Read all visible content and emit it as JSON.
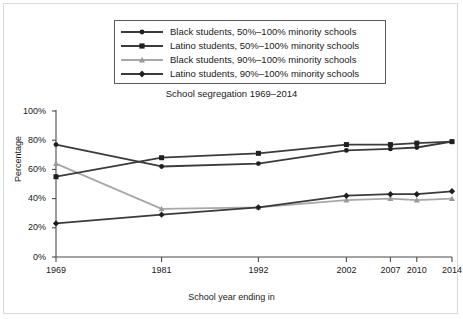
{
  "chart_data": {
    "type": "line",
    "title": "School segregation 1969–2014",
    "xlabel": "School year ending in",
    "ylabel": "Percentage",
    "categories": [
      "1969",
      "1981",
      "1992",
      "2002",
      "2007",
      "2010",
      "2014"
    ],
    "x": [
      1969,
      1981,
      1992,
      2002,
      2007,
      2010,
      2014
    ],
    "xlim": [
      1969,
      2014
    ],
    "ylim": [
      0,
      100
    ],
    "yticks": [
      "0%",
      "20%",
      "40%",
      "60%",
      "80%",
      "100%"
    ],
    "ytick_values": [
      0,
      20,
      40,
      60,
      80,
      100
    ],
    "grid": false,
    "legend_position": "top-center",
    "series": [
      {
        "name": "Black students, 50%–100% minority schools",
        "marker": "circle",
        "color": "#3b3b3b",
        "values": [
          77,
          62,
          64,
          73,
          74,
          75,
          79
        ]
      },
      {
        "name": "Latino students, 50%–100% minority schools",
        "marker": "square",
        "color": "#3b3b3b",
        "values": [
          55,
          68,
          71,
          77,
          77,
          78,
          79
        ]
      },
      {
        "name": "Black students, 90%–100% minority schools",
        "marker": "triangle",
        "color": "#a8a8a8",
        "values": [
          64,
          33,
          34,
          39,
          40,
          39,
          40
        ]
      },
      {
        "name": "Latino students, 90%–100% minority schools",
        "marker": "diamond",
        "color": "#3b3b3b",
        "values": [
          23,
          29,
          34,
          42,
          43,
          43,
          45
        ]
      }
    ]
  },
  "legend": {
    "items": [
      {
        "label": "Black students, 50%–100% minority schools"
      },
      {
        "label": "Latino students, 50%–100% minority schools"
      },
      {
        "label": "Black students, 90%–100% minority schools"
      },
      {
        "label": "Latino students, 90%–100% minority schools"
      }
    ]
  },
  "axes": {
    "y_tick_labels": [
      "100%",
      "80%",
      "60%",
      "40%",
      "20%",
      "0%"
    ],
    "x_tick_labels": [
      "1969",
      "1981",
      "1992",
      "2002",
      "2007",
      "2010",
      "2014"
    ]
  },
  "colors": {
    "dark_series": "#3b3b3b",
    "light_series": "#a8a8a8",
    "axis": "#4a4a4a",
    "frame": "#d9d9d9",
    "text": "#1a1a1a"
  }
}
